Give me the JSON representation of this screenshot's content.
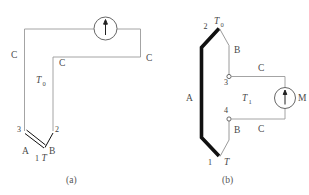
{
  "figure": {
    "background_color": "#ffffff",
    "wire_color": "#9a9a9a",
    "conductor_color": "#111111"
  },
  "panel_a": {
    "caption": "(a)",
    "labels": {
      "c_left": "C",
      "c_right": "C",
      "c_inner": "C",
      "t_zero": "T",
      "t_zero_sub": "0",
      "node_3": "3",
      "node_2": "2",
      "node_1": "1",
      "conductor_a": "A",
      "conductor_b": "B",
      "temp_t": "T"
    },
    "meter": {
      "name": "galvanometer",
      "label": ""
    }
  },
  "panel_b": {
    "caption": "(b)",
    "labels": {
      "node_2": "2",
      "t_zero": "T",
      "t_zero_sub": "0",
      "node_3": "3",
      "node_4": "4",
      "node_1": "1",
      "conductor_a": "A",
      "conductor_b_top": "B",
      "conductor_b_bottom": "B",
      "c_top": "C",
      "c_bottom": "C",
      "t_one": "T",
      "t_one_sub": "1",
      "temp_t": "T"
    },
    "meter": {
      "name": "meter",
      "label": "M"
    }
  }
}
